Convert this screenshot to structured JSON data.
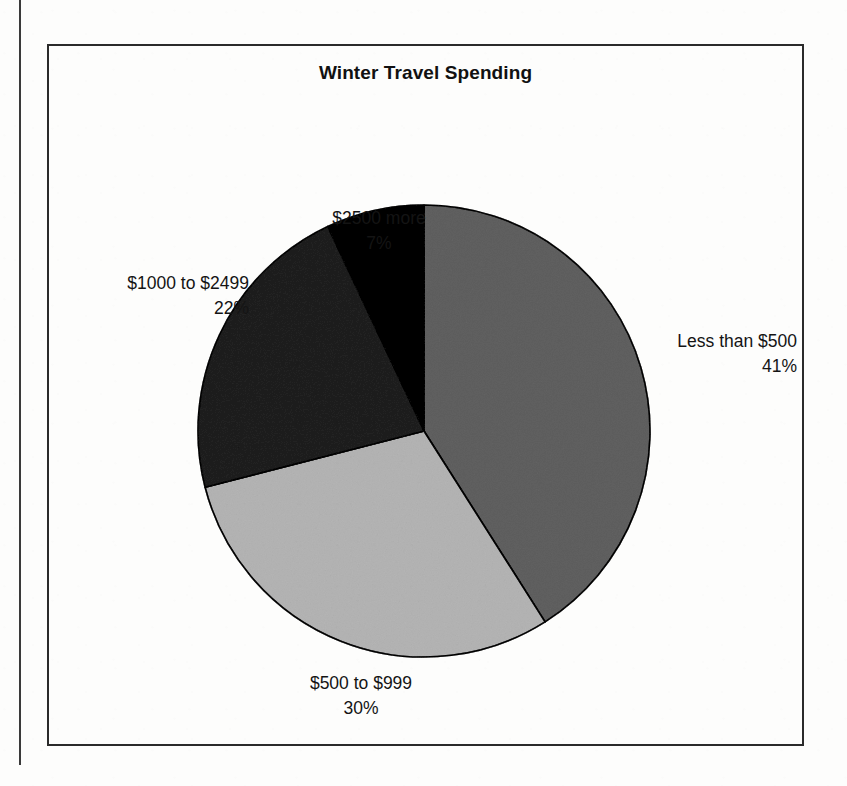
{
  "page": {
    "background_color": "#fdfdfc",
    "frame_color": "#2b2b2b"
  },
  "chart": {
    "title": "Winter Travel Spending"
  },
  "labels": {
    "top": {
      "name": "$2500 more",
      "percent": "7%"
    },
    "right": {
      "name": "Less than $500",
      "percent": "41%"
    },
    "left": {
      "name": "$1000 to $2499",
      "percent": "22%"
    },
    "bottom": {
      "name": "$500 to $999",
      "percent": "30%"
    }
  },
  "chart_data": {
    "type": "pie",
    "title": "Winter Travel Spending",
    "xlabel": "",
    "ylabel": "",
    "legend_position": "none",
    "labels_position": "outside",
    "start_angle_deg": 90,
    "direction": "clockwise",
    "categories": [
      "Less than $500",
      "$500 to $999",
      "$1000 to $2499",
      "$2500 more"
    ],
    "values": [
      41,
      30,
      22,
      7
    ],
    "value_unit": "percent",
    "value_labels": [
      "41%",
      "30%",
      "22%",
      "7%"
    ],
    "colors": [
      "#9b9b9b",
      "#d6d6d6",
      "#585858",
      "#0d0d0d"
    ],
    "slice_edge_color": "#2b2b2b",
    "total": 100,
    "slices": [
      {
        "label": "Less than $500",
        "value": 41,
        "display": "41%",
        "color": "#9b9b9b"
      },
      {
        "label": "$500 to $999",
        "value": 30,
        "display": "30%",
        "color": "#d6d6d6"
      },
      {
        "label": "$1000 to $2499",
        "value": 22,
        "display": "22%",
        "color": "#585858"
      },
      {
        "label": "$2500 more",
        "value": 7,
        "display": "7%",
        "color": "#0d0d0d"
      }
    ]
  }
}
